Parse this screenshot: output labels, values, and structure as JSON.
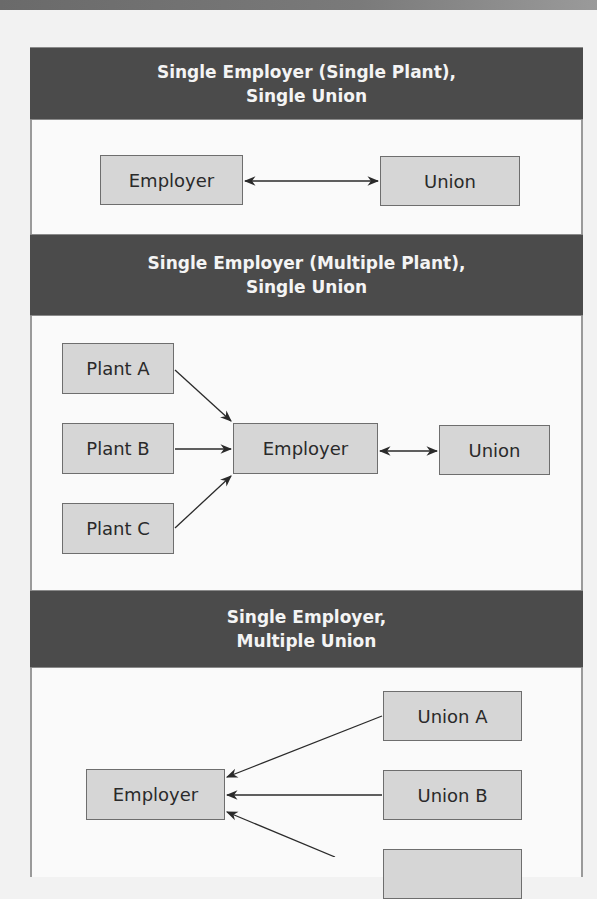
{
  "diagram": {
    "sections": [
      {
        "title_line1": "Single Employer (Single Plant),",
        "title_line2": "Single Union",
        "nodes": {
          "employer": "Employer",
          "union": "Union"
        },
        "edges": [
          {
            "from": "Employer",
            "to": "Union",
            "type": "bidirectional"
          }
        ]
      },
      {
        "title_line1": "Single Employer (Multiple Plant),",
        "title_line2": "Single Union",
        "nodes": {
          "plant_a": "Plant A",
          "plant_b": "Plant B",
          "plant_c": "Plant C",
          "employer": "Employer",
          "union": "Union"
        },
        "edges": [
          {
            "from": "Plant A",
            "to": "Employer",
            "type": "directed"
          },
          {
            "from": "Plant B",
            "to": "Employer",
            "type": "directed"
          },
          {
            "from": "Plant C",
            "to": "Employer",
            "type": "directed"
          },
          {
            "from": "Employer",
            "to": "Union",
            "type": "bidirectional"
          }
        ]
      },
      {
        "title_line1": "Single Employer,",
        "title_line2": "Multiple Union",
        "nodes": {
          "employer": "Employer",
          "union_a": "Union A",
          "union_b": "Union B",
          "union_c": ""
        },
        "edges": [
          {
            "from": "Union A",
            "to": "Employer",
            "type": "directed"
          },
          {
            "from": "Union B",
            "to": "Employer",
            "type": "directed"
          },
          {
            "from": "Union C (cut off)",
            "to": "Employer",
            "type": "directed"
          }
        ]
      }
    ],
    "colors": {
      "header_bg": "#4b4b4b",
      "header_text": "#f4f4f4",
      "box_fill": "#d6d6d6",
      "box_border": "#6e6e6e",
      "arrow": "#2a2a2a"
    }
  }
}
